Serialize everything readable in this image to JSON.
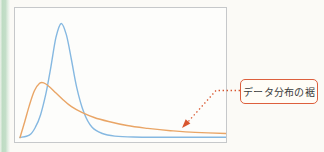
{
  "figure": {
    "background_color": "#fbfaf6",
    "edge_strip_color": "#bedcc3",
    "plot": {
      "frame_color": "#c6c8ca",
      "fill_color": "#fdfdfb"
    },
    "annotation": {
      "label": "データ分布の裾",
      "box_border_color": "#dd5f3d",
      "box_fill_color": "#fffdf7",
      "text_color": "#3a3a3a",
      "arrow_color": "#d8552e",
      "arrow_style": "dotted"
    }
  },
  "chart_data": {
    "type": "line",
    "title": "",
    "xlabel": "",
    "ylabel": "",
    "axes_visible": false,
    "gridlines": false,
    "legend_position": "none",
    "xlim": [
      0,
      1
    ],
    "ylim": [
      0,
      1.05
    ],
    "annotations": [
      {
        "text": "データ分布の裾",
        "arrow_style": "dotted",
        "points_to": {
          "series": "heavy-tailed distribution (orange)",
          "x": 0.79,
          "y": 0.05
        }
      }
    ],
    "series": [
      {
        "name": "sharply peaked distribution (blue)",
        "color": "#85b8e1",
        "points": [
          [
            0,
            0
          ],
          [
            0.045,
            0.02
          ],
          [
            0.075,
            0.09
          ],
          [
            0.1,
            0.2
          ],
          [
            0.125,
            0.38
          ],
          [
            0.15,
            0.62
          ],
          [
            0.175,
            0.88
          ],
          [
            0.2,
            1.0
          ],
          [
            0.225,
            0.9
          ],
          [
            0.25,
            0.68
          ],
          [
            0.275,
            0.44
          ],
          [
            0.31,
            0.22
          ],
          [
            0.35,
            0.09
          ],
          [
            0.4,
            0.035
          ],
          [
            0.46,
            0.012
          ],
          [
            0.55,
            0.004
          ],
          [
            0.7,
            0.002
          ],
          [
            1.0,
            0.002
          ]
        ]
      },
      {
        "name": "heavy-tailed distribution (orange)",
        "color": "#e9a566",
        "points": [
          [
            0,
            0
          ],
          [
            0.02,
            0.12
          ],
          [
            0.045,
            0.28
          ],
          [
            0.07,
            0.41
          ],
          [
            0.095,
            0.475
          ],
          [
            0.115,
            0.48
          ],
          [
            0.14,
            0.45
          ],
          [
            0.175,
            0.39
          ],
          [
            0.21,
            0.33
          ],
          [
            0.25,
            0.27
          ],
          [
            0.3,
            0.22
          ],
          [
            0.36,
            0.175
          ],
          [
            0.43,
            0.14
          ],
          [
            0.52,
            0.105
          ],
          [
            0.62,
            0.08
          ],
          [
            0.73,
            0.06
          ],
          [
            0.85,
            0.045
          ],
          [
            1.0,
            0.035
          ]
        ]
      }
    ]
  }
}
